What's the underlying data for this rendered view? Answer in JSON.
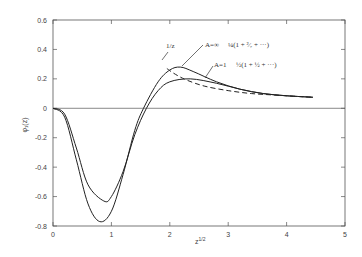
{
  "chart_data": {
    "type": "line",
    "title": "",
    "xlabel": "z^{1/2}",
    "ylabel": "φ1(z)",
    "xlim": [
      0,
      5
    ],
    "ylim": [
      -0.8,
      0.6
    ],
    "xticks": [
      "0",
      "1",
      "2",
      "3",
      "4",
      "5"
    ],
    "yticks": [
      "0.6",
      "0.4",
      "0.2",
      "0",
      "-0.2",
      "-0.4",
      "-0.6",
      "-0.8"
    ],
    "grid": false,
    "zero_line": true,
    "series": [
      {
        "name": "A=∞",
        "annotation": "A=∞  ¼(1 + 2/7 + ···)",
        "style": "solid",
        "x": [
          0,
          0.2,
          0.4,
          0.6,
          0.8,
          1.0,
          1.2,
          1.4,
          1.55,
          1.8,
          2.0,
          2.18,
          2.4,
          2.8,
          3.2,
          3.6,
          4.0,
          4.45
        ],
        "y": [
          0,
          -0.06,
          -0.35,
          -0.65,
          -0.77,
          -0.7,
          -0.45,
          -0.15,
          0.0,
          0.18,
          0.26,
          0.28,
          0.25,
          0.18,
          0.13,
          0.1,
          0.085,
          0.075
        ]
      },
      {
        "name": "A=1",
        "annotation": "A=1  ½(1 + ½ + ···)",
        "style": "solid",
        "x": [
          0,
          0.2,
          0.4,
          0.6,
          0.87,
          1.0,
          1.2,
          1.4,
          1.6,
          1.8,
          2.0,
          2.35,
          2.8,
          3.2,
          3.6,
          4.0,
          4.45
        ],
        "y": [
          0,
          -0.04,
          -0.27,
          -0.52,
          -0.63,
          -0.6,
          -0.43,
          -0.18,
          0.0,
          0.12,
          0.18,
          0.2,
          0.17,
          0.13,
          0.1,
          0.085,
          0.075
        ]
      },
      {
        "name": "1/z",
        "annotation": "1/z",
        "style": "dashed",
        "x": [
          1.95,
          2.1,
          2.3,
          2.6,
          3.0,
          3.4,
          3.8,
          4.2,
          4.45
        ],
        "y": [
          0.27,
          0.23,
          0.19,
          0.15,
          0.12,
          0.1,
          0.09,
          0.08,
          0.075
        ]
      }
    ]
  },
  "labels": {
    "xlabel": "z",
    "xlabel_sup": "1/2",
    "ylabel": "φ₁(z)",
    "ann_inf_a": "A=∞",
    "ann_inf_b": "¼(1 + ²⁄₇ + ···)",
    "ann_one_a": "A=1",
    "ann_one_b": "½(1 + ½ + ···)",
    "ann_dashed": "1/z"
  }
}
